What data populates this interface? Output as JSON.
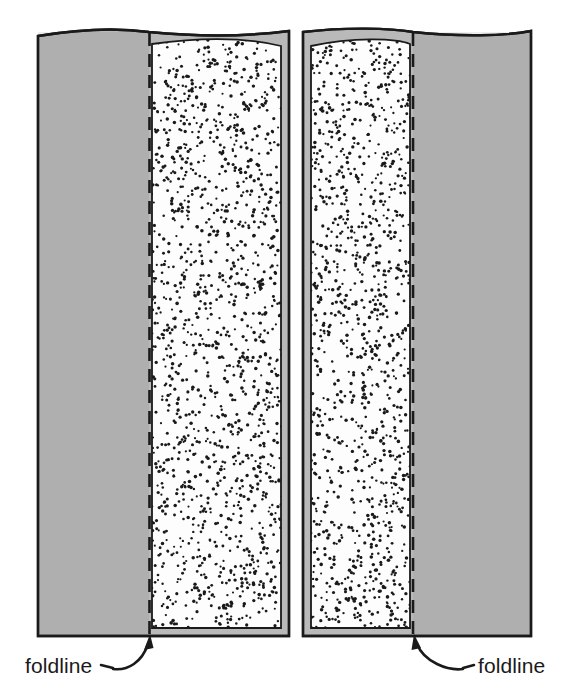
{
  "figure": {
    "background_color": "#ffffff",
    "ink_color": "#1a1a1a",
    "gray_fill_color": "#b9b9b9",
    "stipple_fill_color": "#fdfdfd",
    "stipple_dot_color": "#1a1a1a"
  },
  "panels": [
    {
      "id": "left-panel",
      "name": "left-figure",
      "gray_region_side": "left",
      "stipple_region_side": "right",
      "foldline_x": 149,
      "bounds": {
        "x": 37,
        "y": 30,
        "width": 254,
        "height": 607
      }
    },
    {
      "id": "right-panel",
      "name": "right-figure",
      "gray_region_side": "right",
      "stipple_region_side": "left",
      "foldline_x": 413,
      "bounds": {
        "x": 302,
        "y": 30,
        "width": 230,
        "height": 607
      }
    }
  ],
  "annotations": [
    {
      "id": "left-foldline-label",
      "label": "foldline",
      "text_x": 25,
      "text_y": 673,
      "anchor": "start",
      "leader": "curved-arrow-up-right",
      "points_to_x": 150,
      "points_to_y": 637
    },
    {
      "id": "right-foldline-label",
      "label": "foldline",
      "text_x": 478,
      "text_y": 673,
      "anchor": "start",
      "leader": "curved-arrow-up-left",
      "points_to_x": 413,
      "points_to_y": 637
    }
  ]
}
